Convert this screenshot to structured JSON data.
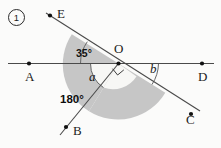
{
  "figure": {
    "item_number": "1",
    "caption_number_display": "①",
    "points": [
      {
        "name": "point-label-E",
        "text": "E",
        "x": 57,
        "y": 7
      },
      {
        "name": "point-label-A",
        "text": "A",
        "x": 25,
        "y": 72
      },
      {
        "name": "point-label-O",
        "text": "O",
        "x": 113,
        "y": 44
      },
      {
        "name": "point-label-D",
        "text": "D",
        "x": 198,
        "y": 72
      },
      {
        "name": "point-label-B",
        "text": "B",
        "x": 72,
        "y": 128
      },
      {
        "name": "point-label-C",
        "text": "C",
        "x": 186,
        "y": 118
      }
    ],
    "angles": [
      {
        "name": "angle-label-35",
        "text": "35°",
        "x": 76,
        "y": 50
      },
      {
        "name": "angle-label-a",
        "text": "a",
        "x": 88,
        "y": 70
      },
      {
        "name": "angle-label-b",
        "text": "b",
        "x": 149,
        "y": 63
      },
      {
        "name": "angle-label-180",
        "text": "180°",
        "x": 62,
        "y": 95
      }
    ],
    "colors": {
      "shaded_fill": "#c6c6c6",
      "inner_white": "#f7f7f5",
      "line_stroke": "#4a4a4a",
      "dot_fill": "#111111",
      "text": "#1b1b1b",
      "background": "#fbfbfa"
    },
    "geometry": {
      "origin": {
        "x": 118.5,
        "y": 63.5
      },
      "ray_A": {
        "x": 8,
        "y": 63.5
      },
      "ray_D": {
        "x": 214,
        "y": 63.5
      },
      "ray_E": {
        "x": 46,
        "y": 13
      },
      "ray_C": {
        "x": 196,
        "y": 109
      },
      "ray_B": {
        "x": 62,
        "y": 132
      },
      "right_angle_marker": true,
      "shaded_sector_start_deg": 35,
      "shaded_sector_end_deg": 180,
      "sector_radius": 47
    }
  }
}
